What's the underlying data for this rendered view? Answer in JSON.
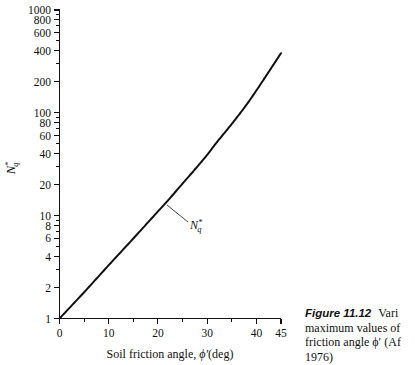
{
  "figure": {
    "caption_number": "Figure 11.12",
    "caption_lines": [
      "Vari",
      "maximum values of",
      "friction angle ϕ′ (Af",
      "1976)"
    ]
  },
  "axes": {
    "x_title": "Soil friction angle, ϕ′(deg)",
    "y_title_base": "N",
    "y_title_sup": "*",
    "y_title_sub": "q",
    "x_ticks_major": [
      0,
      10,
      20,
      30,
      40,
      45
    ],
    "x_ticks_minor": [
      5,
      15,
      25,
      35
    ],
    "y_ticks_labeled": [
      1,
      2,
      4,
      6,
      8,
      10,
      20,
      40,
      60,
      80,
      100,
      200,
      400,
      600,
      800,
      1000
    ]
  },
  "annotations": {
    "curve_label_base": "N",
    "curve_label_sup": "*",
    "curve_label_sub": "q"
  },
  "chart_data": {
    "type": "line",
    "title": "",
    "xlabel": "Soil friction angle, ϕ′(deg)",
    "ylabel": "N*q",
    "xlim": [
      0,
      45
    ],
    "ylim": [
      1,
      1000
    ],
    "yscale": "log",
    "xscale": "linear",
    "grid": false,
    "legend": null,
    "series": [
      {
        "name": "N*q",
        "x": [
          0,
          5,
          10,
          15,
          20,
          22,
          25,
          28,
          30,
          32,
          35,
          38,
          40,
          42,
          45
        ],
        "y": [
          1.0,
          1.8,
          3.3,
          6.0,
          11.0,
          14.0,
          20.5,
          30.0,
          39.0,
          52.0,
          78.0,
          120.0,
          165.0,
          230.0,
          380.0
        ]
      }
    ],
    "curve_endpoint_note": "curve rises to about 1000 at 45 deg on the plotted frame"
  }
}
